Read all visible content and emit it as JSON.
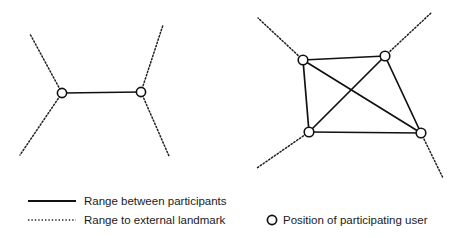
{
  "figure": {
    "background_color": "#ffffff",
    "line_color": "#111111",
    "node_fill_color": "#ffffff",
    "node_stroke_color": "#111111",
    "text_color": "#1a1a1a"
  },
  "diagrams": [
    {
      "id": "two-participant-diagram",
      "name": "Two participant ranging diagram",
      "participant_count": 2,
      "nodes": [
        {
          "id": "L1",
          "label": "left participant",
          "x": 62,
          "y": 93,
          "r": 4.6
        },
        {
          "id": "L2",
          "label": "right participant",
          "x": 141,
          "y": 92,
          "r": 4.6
        }
      ],
      "range_links": [
        {
          "from": "L1",
          "to": "L2"
        }
      ],
      "landmark_rays": [
        {
          "from": "L1",
          "to_x": 30,
          "to_y": 34
        },
        {
          "from": "L1",
          "to_x": 20,
          "to_y": 155
        },
        {
          "from": "L2",
          "to_x": 163,
          "to_y": 25
        },
        {
          "from": "L2",
          "to_x": 169,
          "to_y": 156
        }
      ]
    },
    {
      "id": "four-participant-diagram",
      "name": "Four participant ranging diagram",
      "participant_count": 4,
      "nodes": [
        {
          "id": "R1",
          "label": "top left participant",
          "x": 303,
          "y": 60,
          "r": 4.8
        },
        {
          "id": "R2",
          "label": "top right participant",
          "x": 385,
          "y": 56,
          "r": 4.8
        },
        {
          "id": "R3",
          "label": "bottom left participant",
          "x": 309,
          "y": 132,
          "r": 4.8
        },
        {
          "id": "R4",
          "label": "bottom right participant",
          "x": 421,
          "y": 133,
          "r": 4.8
        }
      ],
      "range_links": [
        {
          "from": "R1",
          "to": "R2"
        },
        {
          "from": "R1",
          "to": "R3"
        },
        {
          "from": "R1",
          "to": "R4"
        },
        {
          "from": "R2",
          "to": "R3"
        },
        {
          "from": "R2",
          "to": "R4"
        },
        {
          "from": "R3",
          "to": "R4"
        }
      ],
      "landmark_rays": [
        {
          "from": "R1",
          "to_x": 258,
          "to_y": 18
        },
        {
          "from": "R2",
          "to_x": 431,
          "to_y": 13
        },
        {
          "from": "R3",
          "to_x": 257,
          "to_y": 168
        },
        {
          "from": "R4",
          "to_x": 443,
          "to_y": 178
        }
      ]
    }
  ],
  "legend": {
    "items": [
      {
        "id": "range-between-participants",
        "marker": "solid-line",
        "label": "Range between participants",
        "x": 28,
        "y": 201,
        "text_x": 84
      },
      {
        "id": "range-to-external-landmark",
        "marker": "dotted-line",
        "label": "Range to external landmark",
        "x": 28,
        "y": 220,
        "text_x": 84
      },
      {
        "id": "position-of-participating-user",
        "marker": "circle",
        "label": "Position of participating user",
        "x": 272,
        "y": 220,
        "text_x": 283
      }
    ]
  }
}
